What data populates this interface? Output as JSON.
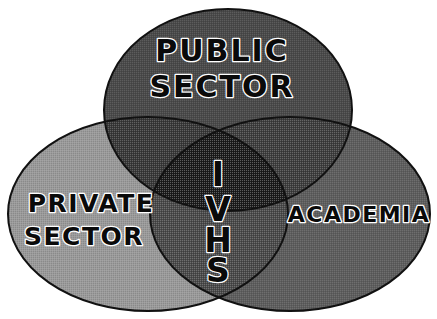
{
  "figure": {
    "type": "venn-diagram",
    "background_color": "#ffffff",
    "outline_color": "#111111",
    "sets": [
      {
        "id": "public-sector",
        "label_lines": [
          "PUBLIC",
          "SECTOR"
        ],
        "label_text": "PUBLIC SECTOR",
        "fill_color": "#4a4a4a",
        "position": "top"
      },
      {
        "id": "private-sector",
        "label_lines": [
          "PRIVATE",
          "SECTOR"
        ],
        "label_text": "PRIVATE SECTOR",
        "fill_color": "#9a9a9a",
        "position": "bottom-left"
      },
      {
        "id": "academia",
        "label_lines": [
          "ACADEMIA"
        ],
        "label_text": "ACADEMIA",
        "fill_color": "#5e5e5e",
        "position": "bottom-right"
      }
    ],
    "intersection": {
      "id": "ivhs-core",
      "label_text": "IVHS",
      "label_letters": [
        "I",
        "V",
        "H",
        "S"
      ],
      "orientation": "vertical-stacked",
      "fill_color": "#1d1d1d"
    },
    "pairwise_overlaps": [
      {
        "id": "public-private",
        "fill_color": "#3a3a3a"
      },
      {
        "id": "public-academia",
        "fill_color": "#3f3f3f"
      },
      {
        "id": "private-academia",
        "fill_color": "#4c4c4c"
      }
    ],
    "text_style": {
      "fill": "#0a0a0a",
      "outline": "#ffffff"
    }
  }
}
